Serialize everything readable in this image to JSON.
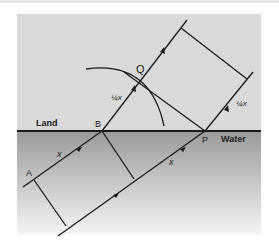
{
  "diagram": {
    "regions": {
      "land_label": "Land",
      "water_label": "Water"
    },
    "points": {
      "A": "A",
      "B": "B",
      "P": "P",
      "Q": "Q"
    },
    "lengths": {
      "water_segment_AB": "x",
      "water_segment_lower": "x",
      "land_segment_BQ": "¼x",
      "land_segment_right": "¼x"
    },
    "colors": {
      "land_fill": "#d9d9d9",
      "water_top": "#9e9e9e",
      "water_bottom": "#f2f2f2",
      "lines": "#1a1a1a"
    }
  }
}
